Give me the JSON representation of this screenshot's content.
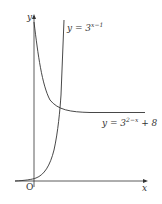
{
  "diagram": {
    "type": "function-graph",
    "axes": {
      "x_label": "x",
      "y_label": "y",
      "origin_label": "O"
    },
    "curves": [
      {
        "name": "y = 3^(x-1)",
        "label_prefix": "y = 3",
        "exponent": "x−1",
        "suffix": ""
      },
      {
        "name": "y = 3^(2-x) + 8",
        "label_prefix": "y = 3",
        "exponent": "2−x",
        "suffix": " + 8"
      }
    ],
    "colors": {
      "stroke": "#333333",
      "background": "#ffffff"
    }
  }
}
